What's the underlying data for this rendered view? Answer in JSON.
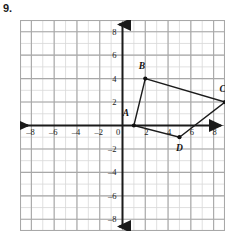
{
  "problem": {
    "number": "9."
  },
  "axes": {
    "x_name": "x",
    "y_name": "y",
    "origin_label": "0",
    "x_ticks": [
      "-8",
      "-6",
      "-4",
      "-2",
      "2",
      "4",
      "6",
      "8"
    ],
    "y_ticks": [
      "8",
      "6",
      "4",
      "2",
      "-2",
      "-4",
      "-6",
      "-8"
    ]
  },
  "chart_data": {
    "type": "scatter",
    "title": "",
    "xlabel": "x",
    "ylabel": "y",
    "xlim": [
      -9,
      9
    ],
    "ylim": [
      -9,
      9
    ],
    "grid": true,
    "grid_minor_step": 1,
    "grid_major_step": 2,
    "legend": "none",
    "x_tick_values": [
      -8,
      -6,
      -4,
      -2,
      0,
      2,
      4,
      6,
      8
    ],
    "y_tick_values": [
      -8,
      -6,
      -4,
      -2,
      0,
      2,
      4,
      6,
      8
    ],
    "annotations": [
      "A",
      "B",
      "C",
      "D"
    ],
    "series": [
      {
        "name": "quadrilateral ABCD",
        "closed": true,
        "points": [
          {
            "label": "A",
            "x": 1,
            "y": 0,
            "label_dx": -0.7,
            "label_dy": 1.1
          },
          {
            "label": "B",
            "x": 2,
            "y": 4,
            "label_dx": -0.3,
            "label_dy": 1.1
          },
          {
            "label": "C",
            "x": 9,
            "y": 2,
            "label_dx": -0.2,
            "label_dy": 1.1
          },
          {
            "label": "D",
            "x": 5,
            "y": -1,
            "label_dx": 0.0,
            "label_dy": -0.9
          }
        ]
      }
    ]
  },
  "colors": {
    "grid_minor": "#d8d8d8",
    "grid_major": "#a8a8a8",
    "axis": "#1b1b1b",
    "shape_stroke": "#1b1b1b",
    "vertex_fill": "#111111",
    "text": "#1b1b1b",
    "background": "#ffffff"
  }
}
